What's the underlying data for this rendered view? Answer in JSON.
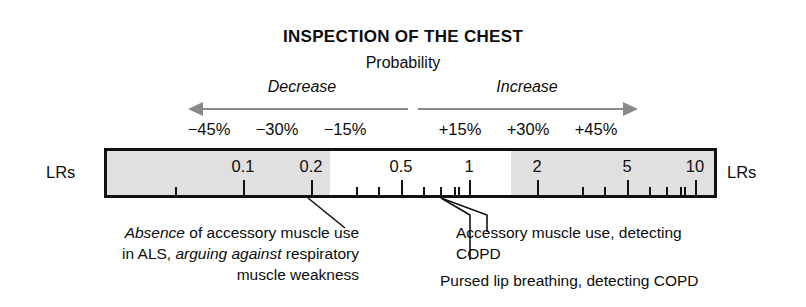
{
  "title": "INSPECTION OF THE CHEST",
  "subtitle": "Probability",
  "directions": {
    "decrease": "Decrease",
    "increase": "Increase"
  },
  "percent_labels": [
    {
      "text": "−45%",
      "x": 209
    },
    {
      "text": "−30%",
      "x": 277
    },
    {
      "text": "−15%",
      "x": 345
    },
    {
      "text": "+15%",
      "x": 460
    },
    {
      "text": "+30%",
      "x": 528
    },
    {
      "text": "+45%",
      "x": 596
    }
  ],
  "scale": {
    "left_label": "LRs",
    "right_label": "LRs",
    "numbers": [
      {
        "value": "0.1",
        "x": 136
      },
      {
        "value": "0.2",
        "x": 204
      },
      {
        "value": "0.5",
        "x": 294
      },
      {
        "value": "1",
        "x": 362
      },
      {
        "value": "2",
        "x": 430
      },
      {
        "value": "5",
        "x": 520
      },
      {
        "value": "10",
        "x": 588
      }
    ],
    "major_ticks": [
      136,
      204,
      294,
      362,
      430,
      520,
      588
    ],
    "minor_ticks": [
      68,
      249,
      271,
      316,
      333,
      347,
      351,
      475,
      497,
      542,
      559,
      573,
      577,
      656,
      701
    ],
    "shaded_regions": [
      {
        "start": 0,
        "end": 223
      },
      {
        "start": 404,
        "end": 607
      }
    ],
    "shade_color": "#e0e0e0",
    "bar_border_color": "#111111"
  },
  "arrows": {
    "color": "#8a8a8a",
    "left_direction": "left",
    "right_direction": "right"
  },
  "annotations": {
    "left": {
      "line1_italic": "Absence",
      "line1_rest": " of accessory muscle use",
      "line2_pre": "in ALS, ",
      "line2_italic": "arguing against",
      "line2_rest": " respiratory",
      "line3": "muscle weakness"
    },
    "right_1": {
      "line1": "Accessory muscle use, detecting",
      "line2": "COPD"
    },
    "right_2": {
      "line1": "Pursed lip breathing, detecting COPD"
    }
  }
}
